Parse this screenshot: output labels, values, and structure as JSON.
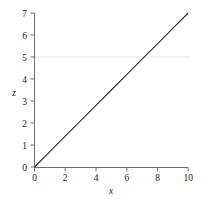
{
  "chart_data": {
    "type": "line",
    "title": "",
    "subtitle": "",
    "xlabel": "x",
    "ylabel": "z",
    "xlim": [
      0,
      10
    ],
    "ylim": [
      0,
      7
    ],
    "xticks": [
      0,
      2,
      4,
      6,
      8,
      10
    ],
    "xtick_labels": [
      "0",
      "2",
      "4",
      "6",
      "8",
      "10"
    ],
    "yticks": [
      0,
      1,
      2,
      3,
      4,
      5,
      6,
      7
    ],
    "ytick_labels": [
      "0",
      "1",
      "2",
      "3",
      "4",
      "5",
      "6",
      "7"
    ],
    "grid": false,
    "gridlines_y": [
      5
    ],
    "legend": null,
    "legend_position": "none",
    "annotations": [],
    "series": [
      {
        "name": "z",
        "type": "line",
        "color": "#2a2a2a",
        "linewidth": 1.1,
        "x": [
          0,
          10
        ],
        "y": [
          0,
          7
        ],
        "slope": 0.7,
        "intercept": 0,
        "points": [
          {
            "x": 0,
            "y": 0
          },
          {
            "x": 1,
            "y": 0.7
          },
          {
            "x": 2,
            "y": 1.4
          },
          {
            "x": 3,
            "y": 2.1
          },
          {
            "x": 4,
            "y": 2.8
          },
          {
            "x": 5,
            "y": 3.5
          },
          {
            "x": 6,
            "y": 4.2
          },
          {
            "x": 7,
            "y": 4.9
          },
          {
            "x": 8,
            "y": 5.6
          },
          {
            "x": 9,
            "y": 6.3
          },
          {
            "x": 10,
            "y": 7
          }
        ]
      }
    ]
  },
  "style": {
    "background": "#ffffff",
    "axis_color": "#6e6e6e",
    "tick_color": "#6e6e6e",
    "text_color": "#1a1a1a",
    "gridline_color": "#e3e3e3",
    "line_color": "#2a2a2a"
  },
  "axes": {
    "x_title": "x",
    "y_title": "z"
  }
}
